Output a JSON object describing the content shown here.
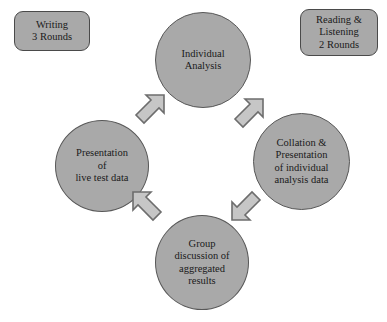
{
  "diagram": {
    "colors": {
      "node_fill": "#a9a9a9",
      "node_stroke": "#585858",
      "arrow_fill": "#c6c6c6",
      "arrow_stroke": "#6d6d6d",
      "text": "#1a1a1a",
      "background": "#ffffff"
    },
    "label_boxes": [
      {
        "id": "writing",
        "lines": [
          "Writing",
          "3 Rounds"
        ],
        "line1": "Writing",
        "line2": "3 Rounds"
      },
      {
        "id": "reading-listening",
        "lines": [
          "Reading &",
          "Listening",
          "2 Rounds"
        ],
        "line1": "Reading &",
        "line2": "Listening",
        "line3": "2 Rounds"
      }
    ],
    "nodes": [
      {
        "id": "individual-analysis",
        "position": "top",
        "lines": [
          "Individual",
          "Analysis"
        ],
        "line1": "Individual",
        "line2": "Analysis"
      },
      {
        "id": "collation-presentation",
        "position": "right",
        "lines": [
          "Collation &",
          "Presentation",
          "of individual",
          "analysis data"
        ],
        "line1": "Collation &",
        "line2": "Presentation",
        "line3": "of individual",
        "line4": "analysis data"
      },
      {
        "id": "group-discussion",
        "position": "bottom",
        "lines": [
          "Group",
          "discussion of",
          "aggregated",
          "results"
        ],
        "line1": "Group",
        "line2": "discussion of",
        "line3": "aggregated",
        "line4": "results"
      },
      {
        "id": "presentation-live-test-data",
        "position": "left",
        "lines": [
          "Presentation",
          "of",
          "live test data"
        ],
        "line1": "Presentation",
        "line2": "of",
        "line3": "live test data"
      }
    ],
    "arrows": [
      {
        "id": "arrow-presentation-to-individual",
        "direction": "northeast",
        "from": "presentation-live-test-data",
        "to": "individual-analysis"
      },
      {
        "id": "arrow-individual-to-collation",
        "direction": "southeast",
        "from": "individual-analysis",
        "to": "collation-presentation"
      },
      {
        "id": "arrow-collation-to-group",
        "direction": "southwest",
        "from": "collation-presentation",
        "to": "group-discussion"
      },
      {
        "id": "arrow-group-to-presentation",
        "direction": "northwest",
        "from": "group-discussion",
        "to": "presentation-live-test-data"
      }
    ]
  }
}
